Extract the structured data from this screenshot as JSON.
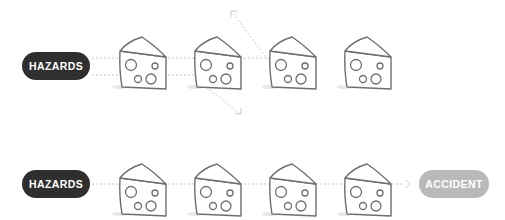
{
  "top_row": {
    "source_label": "HAZARDS",
    "slices": 4,
    "blocked": true
  },
  "bottom_row": {
    "source_label": "HAZARDS",
    "target_label": "ACCIDENT",
    "slices": 4,
    "blocked": false
  },
  "colors": {
    "hazards_fill": "#2f2f2f",
    "accident_fill": "#b9b9b9",
    "cheese_stroke": "#6e6e6e",
    "path_stroke": "#c8c8c8"
  }
}
